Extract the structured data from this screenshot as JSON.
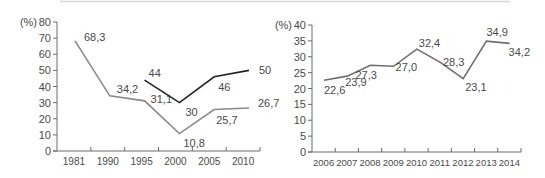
{
  "chart_data": [
    {
      "type": "line",
      "title": "",
      "xlabel": "",
      "ylabel": "(%)",
      "ylim": [
        0,
        80
      ],
      "yticks": [
        0,
        10,
        20,
        30,
        40,
        50,
        60,
        70,
        80
      ],
      "categories": [
        "1981",
        "1990",
        "1995",
        "2000",
        "2005",
        "2010"
      ],
      "series": [
        {
          "name": "gray series",
          "color": "#8a8a8a",
          "values": [
            68.3,
            34.2,
            31.1,
            10.8,
            25.7,
            26.7
          ],
          "labels": [
            "68,3",
            "34,2",
            "31,1",
            "10,8",
            "25,7",
            "26,7"
          ]
        },
        {
          "name": "black series",
          "color": "#222222",
          "values": [
            null,
            null,
            44,
            30,
            46,
            50
          ],
          "labels": [
            "",
            "",
            "44",
            "30",
            "46",
            "50"
          ]
        }
      ],
      "grid": false,
      "legend": "none"
    },
    {
      "type": "line",
      "title": "",
      "xlabel": "",
      "ylabel": "(%)",
      "ylim": [
        0,
        40
      ],
      "yticks": [
        0,
        5,
        10,
        15,
        20,
        25,
        30,
        35,
        40
      ],
      "categories": [
        "2006",
        "2007",
        "2008",
        "2009",
        "2010",
        "2011",
        "2012",
        "2013",
        "2014"
      ],
      "series": [
        {
          "name": "series",
          "color": "#6e6e6e",
          "values": [
            22.6,
            23.9,
            27.3,
            27.0,
            32.4,
            28.3,
            23.1,
            34.9,
            34.2
          ],
          "labels": [
            "22,6",
            "23,9",
            "27,3",
            "27,0",
            "32,4",
            "28,3",
            "23,1",
            "34,9",
            "34,2"
          ]
        }
      ],
      "grid": false,
      "legend": "none"
    }
  ]
}
